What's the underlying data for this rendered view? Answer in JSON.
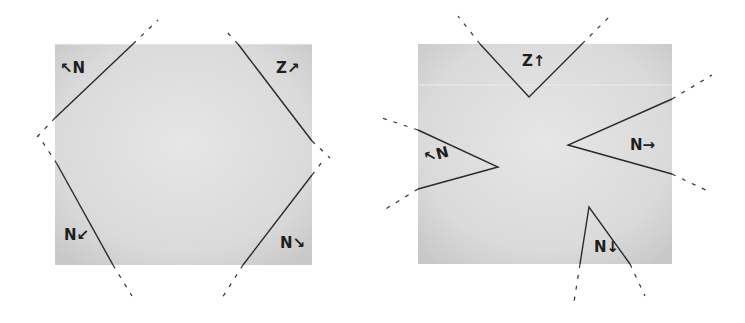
{
  "figure": {
    "panels": [
      {
        "id": "left",
        "description": "Square sheet with four corners folded/cut off along diagonal lines, forming an octagon",
        "labels": [
          {
            "position": "top-left",
            "text": "↖N"
          },
          {
            "position": "top-right",
            "text": "Z↗"
          },
          {
            "position": "bottom-left",
            "text": "N↙"
          },
          {
            "position": "bottom-right",
            "text": "N↘"
          }
        ]
      },
      {
        "id": "right",
        "description": "Square sheet with four triangular wedges cut inward from each edge",
        "labels": [
          {
            "position": "top",
            "text": "Z↑"
          },
          {
            "position": "left",
            "text": "↖N"
          },
          {
            "position": "right",
            "text": "N→"
          },
          {
            "position": "bottom",
            "text": "N↓"
          }
        ]
      }
    ],
    "colors": {
      "paper": "#d9d9d9",
      "paper_light": "#e8e8e8",
      "line": "#2a2a2a",
      "background": "#ffffff"
    }
  }
}
